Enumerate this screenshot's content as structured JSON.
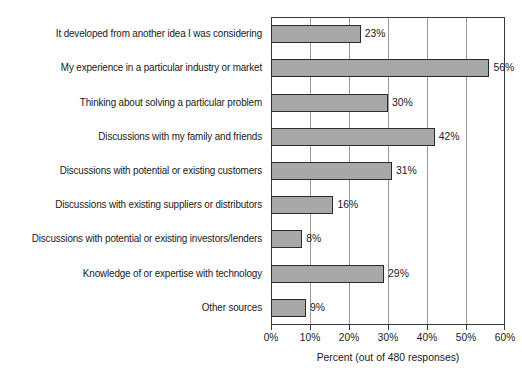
{
  "chart_data": {
    "type": "bar",
    "orientation": "horizontal",
    "title": "",
    "xlabel": "Percent (out of 480 responses)",
    "ylabel": "",
    "xlim": [
      0,
      60
    ],
    "xticks": [
      "0%",
      "10%",
      "20%",
      "30%",
      "40%",
      "50%",
      "60%"
    ],
    "xtick_values": [
      0,
      10,
      20,
      30,
      40,
      50,
      60
    ],
    "grid": "vertical",
    "legend": "none",
    "categories": [
      "It developed from another idea I was considering",
      "My experience in a particular industry or market",
      "Thinking about solving a particular problem",
      "Discussions with my family and friends",
      "Discussions with potential or existing customers",
      "Discussions with existing suppliers or distributors",
      "Discussions with potential or existing investors/lenders",
      "Knowledge of or expertise with technology",
      "Other sources"
    ],
    "values": [
      23,
      56,
      30,
      42,
      31,
      16,
      8,
      29,
      9
    ],
    "value_labels": [
      "23%",
      "56%",
      "30%",
      "42%",
      "31%",
      "16%",
      "8%",
      "29%",
      "9%"
    ],
    "colors": {
      "bar_fill": "#a8a8a8",
      "bar_border": "#2b2b2b",
      "gridline": "#9a9a9a",
      "axis": "#3a3a3a",
      "background": "#ffffff",
      "text": "#1a1a1a"
    }
  }
}
